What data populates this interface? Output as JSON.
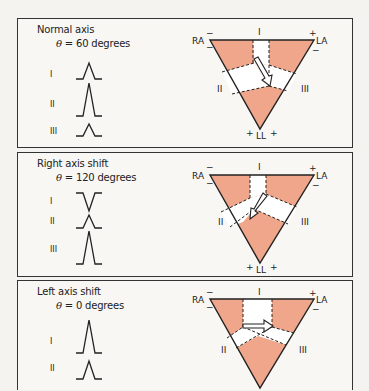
{
  "colors": {
    "fill": "#efa68b",
    "line": "#222222",
    "background": "#f8f7f4"
  },
  "panels": [
    {
      "title": "Normal axis",
      "theta_symbol": "θ",
      "theta_text": "= 60 degrees",
      "angle_degrees": 60,
      "leads": [
        {
          "label": "I",
          "deflection": "positive-small"
        },
        {
          "label": "II",
          "deflection": "positive-large"
        },
        {
          "label": "III",
          "deflection": "positive-small"
        }
      ],
      "triangle": {
        "vertices": {
          "RA": "RA",
          "LA": "LA",
          "LL": "LL"
        },
        "sides": {
          "top": "I",
          "left": "II",
          "right": "III"
        },
        "signs": {
          "RA_top": "−",
          "RA_left": "−",
          "LA_top": "+",
          "LA_right": "−",
          "LL_left": "+",
          "LL_right": "+"
        },
        "arrow_direction": "down-right (60°)"
      }
    },
    {
      "title": "Right axis shift",
      "theta_symbol": "θ",
      "theta_text": "= 120 degrees",
      "angle_degrees": 120,
      "leads": [
        {
          "label": "I",
          "deflection": "negative"
        },
        {
          "label": "II",
          "deflection": "positive-small"
        },
        {
          "label": "III",
          "deflection": "positive-large"
        }
      ],
      "triangle": {
        "vertices": {
          "RA": "RA",
          "LA": "LA",
          "LL": "LL"
        },
        "sides": {
          "top": "I",
          "left": "II",
          "right": "III"
        },
        "signs": {
          "RA_top": "−",
          "RA_left": "−",
          "LA_top": "+",
          "LA_right": "−",
          "LL_left": "+",
          "LL_right": "+"
        },
        "arrow_direction": "down-left (120°)"
      }
    },
    {
      "title": "Left axis shift",
      "theta_symbol": "θ",
      "theta_text": "= 0 degrees",
      "angle_degrees": 0,
      "leads": [
        {
          "label": "I",
          "deflection": "positive-large"
        },
        {
          "label": "II",
          "deflection": "positive-small"
        }
      ],
      "triangle": {
        "vertices": {
          "RA": "RA",
          "LA": "LA"
        },
        "sides": {
          "top": "I",
          "left": "II",
          "right": "III"
        },
        "signs": {
          "RA_top": "−",
          "RA_left": "−",
          "LA_top": "+",
          "LA_right": "−"
        },
        "arrow_direction": "right (0°)"
      }
    }
  ]
}
